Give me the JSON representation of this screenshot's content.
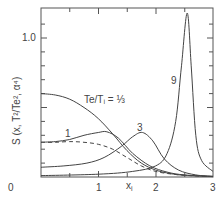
{
  "chart_data": {
    "type": "line",
    "title": "",
    "xlabel": "x_i",
    "ylabel": "S (x, T²/Te², α⁴)",
    "xlim": [
      0,
      3
    ],
    "ylim": [
      0,
      1.2
    ],
    "x_ticks": [
      "0",
      "1",
      "2",
      "3"
    ],
    "y_ticks": [
      "1.0"
    ],
    "grid": false,
    "annotations": [
      "Te/Ti = 1/3",
      "1",
      "3",
      "9"
    ],
    "series": [
      {
        "name": "Te/Ti = 1/3",
        "style": "solid",
        "x": [
          0,
          0.25,
          0.5,
          0.75,
          1.0,
          1.25,
          1.5,
          1.75,
          2.0,
          2.25,
          2.5,
          3.0
        ],
        "y": [
          0.6,
          0.59,
          0.56,
          0.5,
          0.42,
          0.31,
          0.19,
          0.1,
          0.05,
          0.025,
          0.012,
          0.003
        ]
      },
      {
        "name": "1",
        "style": "solid",
        "x": [
          0,
          0.25,
          0.5,
          0.75,
          1.0,
          1.15,
          1.35,
          1.6,
          1.9,
          2.2,
          2.5,
          3.0
        ],
        "y": [
          0.25,
          0.255,
          0.27,
          0.3,
          0.32,
          0.325,
          0.28,
          0.17,
          0.08,
          0.035,
          0.015,
          0.004
        ]
      },
      {
        "name": "1 (dashed)",
        "style": "dashed",
        "x": [
          0,
          0.25,
          0.5,
          0.75,
          1.0,
          1.25,
          1.5,
          1.75,
          2.0,
          2.3,
          2.6,
          3.0
        ],
        "y": [
          0.25,
          0.25,
          0.255,
          0.25,
          0.235,
          0.2,
          0.14,
          0.08,
          0.04,
          0.02,
          0.01,
          0.003
        ]
      },
      {
        "name": "3",
        "style": "solid",
        "x": [
          0,
          0.4,
          0.8,
          1.1,
          1.4,
          1.6,
          1.77,
          1.95,
          2.15,
          2.4,
          2.7,
          3.0
        ],
        "y": [
          0.07,
          0.08,
          0.1,
          0.14,
          0.22,
          0.29,
          0.32,
          0.26,
          0.13,
          0.05,
          0.015,
          0.005
        ]
      },
      {
        "name": "9",
        "style": "solid",
        "x": [
          0,
          1.0,
          1.6,
          2.0,
          2.2,
          2.35,
          2.45,
          2.55,
          2.62,
          2.7,
          2.8,
          3.0
        ],
        "y": [
          0.01,
          0.02,
          0.04,
          0.08,
          0.17,
          0.4,
          0.8,
          1.18,
          0.8,
          0.3,
          0.12,
          0.04
        ]
      }
    ]
  },
  "labels": {
    "x_axis": "x",
    "x_axis_sub": "i",
    "y_axis": "S (x, T²/Te², α⁴)",
    "tick_0": "0",
    "tick_1": "1",
    "tick_2": "2",
    "tick_3": "3",
    "tick_y1": "1.0",
    "ratio_label": "Te/Tᵢ = ⅓",
    "curve_1": "1",
    "curve_3": "3",
    "curve_9": "9"
  }
}
